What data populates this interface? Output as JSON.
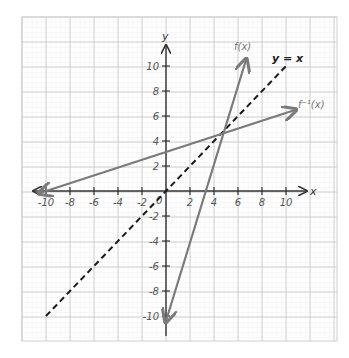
{
  "chart_data": {
    "type": "line",
    "title": "",
    "xlabel": "x",
    "ylabel": "y",
    "xlim": [
      -11,
      11
    ],
    "ylim": [
      -11,
      11
    ],
    "grid": true,
    "x_ticks": [
      -10,
      -8,
      -6,
      -4,
      -2,
      2,
      4,
      6,
      8,
      10
    ],
    "y_ticks": [
      10,
      8,
      6,
      4,
      2,
      -2,
      -4,
      -6,
      -8,
      -10
    ],
    "origin_label": "0",
    "series": [
      {
        "name": "f(x)",
        "label": "f(x)",
        "equation": "y = 3x - 10",
        "style": "solid",
        "color": "#7a7a7a",
        "points": [
          [
            0,
            -10
          ],
          [
            6.7,
            10.2
          ]
        ],
        "arrows": "both"
      },
      {
        "name": "y = x",
        "label": "y = x",
        "equation": "y = x",
        "style": "dashed",
        "color": "#1a1a1a",
        "points": [
          [
            -10,
            -10
          ],
          [
            10,
            10
          ]
        ],
        "arrows": "none"
      },
      {
        "name": "f^-1(x)",
        "label": "f⁻¹(x)",
        "equation": "y = (x + 10) / 3",
        "style": "solid",
        "color": "#7a7a7a",
        "points": [
          [
            -10,
            0
          ],
          [
            10.8,
            6.6
          ]
        ],
        "arrows": "both"
      }
    ],
    "intersection": [
      5,
      5
    ]
  },
  "labels": {
    "x_axis": "x",
    "y_axis": "y",
    "f": "f(x)",
    "yx": "y = x",
    "finv": "f⁻¹(x)"
  }
}
